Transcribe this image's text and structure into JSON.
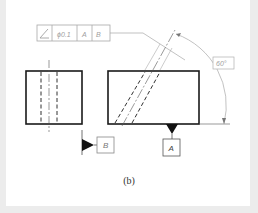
{
  "figure": {
    "caption": "(b)"
  },
  "feature_control_frame": {
    "symbol": "angularity-icon",
    "tolerance": "ϕ0.1",
    "datum_primary": "A",
    "datum_secondary": "B"
  },
  "angle_dimension": {
    "value": "60°"
  },
  "datum_labels": {
    "a": "A",
    "b": "B"
  },
  "colors": {
    "outline": "#1a1a1a",
    "thin": "#8a8a8a",
    "frame_text": "#9a9a9a",
    "border": "#ececec"
  }
}
